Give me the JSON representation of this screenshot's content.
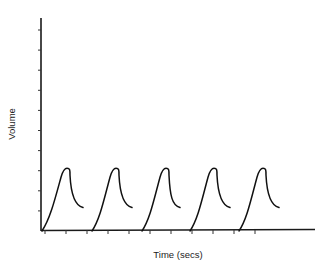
{
  "chart_data": {
    "type": "line",
    "title": "",
    "xlabel": "Time (secs)",
    "ylabel": "Volume",
    "grid": false,
    "legend": null,
    "x_ticks_labeled": false,
    "y_ticks_labeled": false,
    "y_tick_count": 10,
    "x_tick_count": 12,
    "series": [
      {
        "name": "breath-waveform",
        "description": "Five repeated volume cycles: gradual rise from baseline to a rounded peak, then a quick drop that tapers partway down",
        "cycles": [
          {
            "start_x": 42,
            "peak_x": 67,
            "end_x": 83
          },
          {
            "start_x": 92,
            "peak_x": 116,
            "end_x": 132
          },
          {
            "start_x": 142,
            "peak_x": 166,
            "end_x": 180
          },
          {
            "start_x": 190,
            "peak_x": 214,
            "end_x": 230
          },
          {
            "start_x": 239,
            "peak_x": 263,
            "end_x": 279
          }
        ],
        "relative_peak_height": 0.29,
        "relative_end_height": 0.11
      }
    ]
  }
}
